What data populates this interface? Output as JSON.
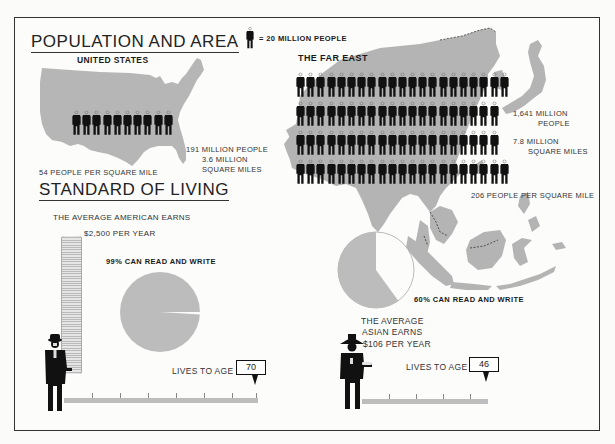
{
  "legend": {
    "icon": "person-figure-icon",
    "text": "= 20 MILLION PEOPLE",
    "unit_millions": 20
  },
  "population_and_area": {
    "title": "POPULATION AND AREA",
    "united_states": {
      "heading": "UNITED STATES",
      "figure_count": 10,
      "population_label": "191 MILLION PEOPLE",
      "area_label_1": "3.6 MILLION",
      "area_label_2": "SQUARE MILES",
      "density_label": "54 PEOPLE PER SQUARE MILE"
    },
    "far_east": {
      "heading": "THE FAR EAST",
      "figure_rows": [
        21,
        20,
        20,
        21
      ],
      "population_label_1": "1,641 MILLION",
      "population_label_2": "PEOPLE",
      "area_label_1": "7.8 MILLION",
      "area_label_2": "SQUARE MILES",
      "density_label": "206 PEOPLE PER SQUARE MILE"
    }
  },
  "standard_of_living": {
    "title": "STANDARD OF LIVING",
    "american": {
      "earns_label": "THE AVERAGE AMERICAN EARNS",
      "income_label": "$2,500 PER YEAR",
      "literacy_label": "99% CAN READ AND WRITE",
      "literacy_pct": 99,
      "lifespan_label": "LIVES TO AGE",
      "lifespan": "70"
    },
    "asian": {
      "earns_line_1": "THE AVERAGE",
      "earns_line_2": "ASIAN EARNS",
      "income_label": "$106  PER YEAR",
      "literacy_label": "60% CAN READ AND WRITE",
      "literacy_pct": 60,
      "lifespan_label": "LIVES TO AGE",
      "lifespan": "46"
    }
  },
  "colors": {
    "map_gray": "#b4b4b4",
    "pie_gray": "#bcbcbc",
    "figure_black": "#111111",
    "frame": "#333333",
    "background": "#fbfbfa"
  }
}
